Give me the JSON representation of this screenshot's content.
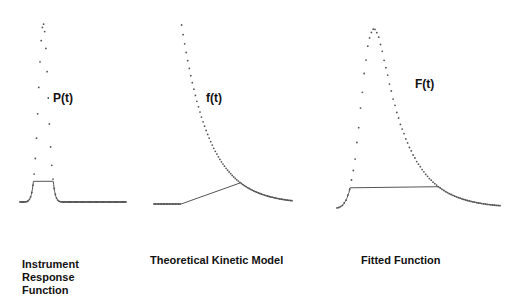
{
  "chart_data": [
    {
      "type": "scatter",
      "name": "instrument-response",
      "curve_label": "P(t)",
      "caption": [
        "Instrument",
        "Response",
        "Function"
      ],
      "model": "gaussian",
      "peak_time": 0.22,
      "width": 0.045,
      "baseline": 0.0,
      "t_range": [
        0,
        1
      ],
      "points": 90
    },
    {
      "type": "scatter",
      "name": "theoretical-kinetic-model",
      "curve_label": "f(t)",
      "caption": [
        "Theoretical Kinetic Model"
      ],
      "model": "exponential-decay",
      "onset_time": 0.2,
      "decay_constant": 0.2,
      "baseline": 0.0,
      "t_range": [
        0,
        1
      ],
      "points": 90
    },
    {
      "type": "scatter",
      "name": "fitted-function",
      "curve_label": "F(t)",
      "caption": [
        "Fitted Function"
      ],
      "model": "convolution",
      "peak_time": 0.33,
      "baseline": 0.0,
      "t_range": [
        0,
        1
      ],
      "points": 90
    }
  ],
  "colors": {
    "points": "#555555",
    "text": "#111111"
  }
}
